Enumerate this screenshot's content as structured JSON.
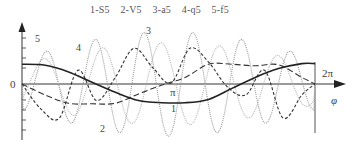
{
  "chart_data": {
    "type": "line",
    "title": "",
    "legend": [
      "1-S5",
      "2-V5",
      "3-a5",
      "4-q5",
      "5-f5"
    ],
    "legend_position": "top",
    "xlabel": "φ",
    "ylabel": "",
    "x_ticks": [
      "0",
      "π",
      "2π"
    ],
    "xlim": [
      0,
      6.283
    ],
    "ylim": [
      -1,
      1
    ],
    "grid": false,
    "series": [
      {
        "name": "S5",
        "label": "1",
        "style": "solid",
        "color": "#222222",
        "x": [
          0,
          0.5,
          1,
          1.5,
          2,
          2.5,
          3,
          3.5,
          4,
          4.5,
          5,
          5.5,
          6,
          6.283
        ],
        "values": [
          0.36,
          0.34,
          0.22,
          0.03,
          -0.15,
          -0.3,
          -0.34,
          -0.34,
          -0.28,
          -0.08,
          0.12,
          0.28,
          0.37,
          0.37
        ]
      },
      {
        "name": "V5",
        "label": "2",
        "style": "long-dash",
        "color": "#333333",
        "x": [
          0,
          0.5,
          1,
          1.5,
          2,
          2.5,
          3,
          3.5,
          4,
          4.5,
          5,
          5.5,
          6,
          6.283
        ],
        "values": [
          0,
          -0.2,
          -0.35,
          -0.36,
          -0.35,
          -0.18,
          -0.02,
          0.12,
          0.36,
          0.36,
          0.33,
          0.35,
          0.12,
          0
        ]
      },
      {
        "name": "a5",
        "label": "3",
        "style": "short-dash",
        "color": "#333333",
        "x": [
          0,
          0.4,
          0.8,
          1.2,
          1.6,
          2,
          2.4,
          2.8,
          3.2,
          3.6,
          4,
          4.4,
          4.8,
          5.2,
          5.6,
          6,
          6.283
        ],
        "values": [
          0,
          -0.45,
          -0.62,
          0.25,
          -0.3,
          0.12,
          0.65,
          0.3,
          0.02,
          0.65,
          0.4,
          -0.05,
          -0.2,
          0.25,
          -0.62,
          -0.2,
          0
        ]
      },
      {
        "name": "q5",
        "label": "4",
        "style": "dotted-light",
        "color": "#b5b5b5",
        "amplitude": 0.75,
        "cycles": 5
      },
      {
        "name": "f5",
        "label": "5",
        "style": "dotted",
        "color": "#9a9a9a",
        "amplitude": 0.95,
        "cycles": 6
      }
    ]
  },
  "labels": {
    "origin": "0",
    "pi": "π",
    "two_pi": "2π",
    "phi": "φ",
    "curve1": "1",
    "curve2": "2",
    "curve3": "3",
    "curve4": "4",
    "curve5": "5"
  }
}
